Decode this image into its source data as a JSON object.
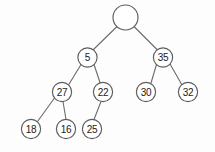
{
  "figure": {
    "kind": "binary-search-tree-diagram",
    "title": "",
    "background_color": "#fdfdfd",
    "node_fill_color": "#ffffff",
    "node_stroke_color": "#5c5c5c",
    "edge_color": "#6b6b6b",
    "label_color": "#1a1a1a"
  },
  "nodes": [
    {
      "id": "root",
      "label": "",
      "cx": 125.5,
      "cy": 17.5,
      "r": 12.5,
      "level": 0,
      "empty": true
    },
    {
      "id": "n5",
      "label": "5",
      "cx": 87.5,
      "cy": 57.5,
      "r": 9.6,
      "level": 1,
      "empty": false
    },
    {
      "id": "n35",
      "label": "35",
      "cx": 163.0,
      "cy": 57.5,
      "r": 9.6,
      "level": 1,
      "empty": false
    },
    {
      "id": "n27",
      "label": "27",
      "cx": 62.0,
      "cy": 92.0,
      "r": 9.6,
      "level": 2,
      "empty": false
    },
    {
      "id": "n22",
      "label": "22",
      "cx": 103.0,
      "cy": 92.0,
      "r": 9.6,
      "level": 2,
      "empty": false
    },
    {
      "id": "n30",
      "label": "30",
      "cx": 146.0,
      "cy": 92.0,
      "r": 9.6,
      "level": 2,
      "empty": false
    },
    {
      "id": "n32",
      "label": "32",
      "cx": 188.0,
      "cy": 92.0,
      "r": 9.6,
      "level": 2,
      "empty": false
    },
    {
      "id": "n18",
      "label": "18",
      "cx": 31.0,
      "cy": 129.0,
      "r": 9.6,
      "level": 3,
      "empty": false
    },
    {
      "id": "n16",
      "label": "16",
      "cx": 66.0,
      "cy": 129.0,
      "r": 9.6,
      "level": 3,
      "empty": false
    },
    {
      "id": "n25",
      "label": "25",
      "cx": 92.0,
      "cy": 129.0,
      "r": 9.6,
      "level": 3,
      "empty": false
    }
  ],
  "edges": [
    {
      "id": "e-root-5",
      "from": "root",
      "to": "n5",
      "x1": 117.0,
      "y1": 26.5,
      "x2": 93.5,
      "y2": 49.5
    },
    {
      "id": "e-root-35",
      "from": "root",
      "to": "n35",
      "x1": 134.0,
      "y1": 26.5,
      "x2": 157.0,
      "y2": 49.5
    },
    {
      "id": "e-5-27",
      "from": "n5",
      "to": "n27",
      "x1": 81.0,
      "y1": 64.5,
      "x2": 68.5,
      "y2": 85.0
    },
    {
      "id": "e-5-22",
      "from": "n5",
      "to": "n22",
      "x1": 94.0,
      "y1": 64.5,
      "x2": 100.0,
      "y2": 82.5
    },
    {
      "id": "e-35-30",
      "from": "n35",
      "to": "n30",
      "x1": 156.5,
      "y1": 64.5,
      "x2": 151.0,
      "y2": 83.0
    },
    {
      "id": "e-35-32",
      "from": "n35",
      "to": "n32",
      "x1": 170.0,
      "y1": 64.0,
      "x2": 182.0,
      "y2": 85.0
    },
    {
      "id": "e-27-18",
      "from": "n27",
      "to": "n18",
      "x1": 54.5,
      "y1": 98.0,
      "x2": 37.5,
      "y2": 121.5
    },
    {
      "id": "e-27-16",
      "from": "n27",
      "to": "n16",
      "x1": 63.0,
      "y1": 101.5,
      "x2": 66.0,
      "y2": 119.5
    },
    {
      "id": "e-22-25",
      "from": "n22",
      "to": "n25",
      "x1": 101.0,
      "y1": 101.5,
      "x2": 94.0,
      "y2": 119.5
    }
  ]
}
